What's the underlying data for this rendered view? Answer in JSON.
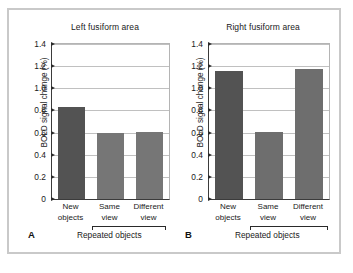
{
  "figure": {
    "background_color": "#ffffff",
    "frame_color": "#c9c9c9"
  },
  "chart_data": [
    {
      "type": "bar",
      "panel_letter": "A",
      "title": "Left fusiform area",
      "xlabel": "Repeated objects",
      "ylabel": "BOLD signal change (%)",
      "categories": [
        "New objects",
        "Same view",
        "Different view"
      ],
      "category_lines": [
        [
          "New",
          "objects"
        ],
        [
          "Same",
          "view"
        ],
        [
          "Different",
          "view"
        ]
      ],
      "values": [
        0.83,
        0.6,
        0.605
      ],
      "bar_colors": [
        "#535353",
        "#767676",
        "#767676"
      ],
      "ylim": [
        0,
        1.4
      ],
      "yticks": [
        0,
        0.2,
        0.4,
        0.6,
        0.8,
        1.0,
        1.2,
        1.4
      ],
      "ytick_labels": [
        "0",
        "0.2",
        "0.4",
        "0.6",
        "0.8",
        "1.0",
        "1.2",
        "1.4"
      ],
      "grid": true,
      "legend": "none",
      "bracket_group": [
        "Same view",
        "Different view"
      ],
      "bracket_label": "Repeated objects"
    },
    {
      "type": "bar",
      "panel_letter": "B",
      "title": "Right fusiform area",
      "xlabel": "Repeated objects",
      "ylabel": "BOLD signal change (%)",
      "categories": [
        "New objects",
        "Same view",
        "Different view"
      ],
      "category_lines": [
        [
          "New",
          "objects"
        ],
        [
          "Same",
          "view"
        ],
        [
          "Different",
          "view"
        ]
      ],
      "values": [
        1.16,
        0.605,
        1.17
      ],
      "bar_colors": [
        "#535353",
        "#6e6e6e",
        "#6e6e6e"
      ],
      "ylim": [
        0,
        1.4
      ],
      "yticks": [
        0,
        0.2,
        0.4,
        0.6,
        0.8,
        1.0,
        1.2,
        1.4
      ],
      "ytick_labels": [
        "0",
        "0.2",
        "0.4",
        "0.6",
        "0.8",
        "1.0",
        "1.2",
        "1.4"
      ],
      "grid": true,
      "legend": "none",
      "bracket_group": [
        "Same view",
        "Different view"
      ],
      "bracket_label": "Repeated objects"
    }
  ]
}
